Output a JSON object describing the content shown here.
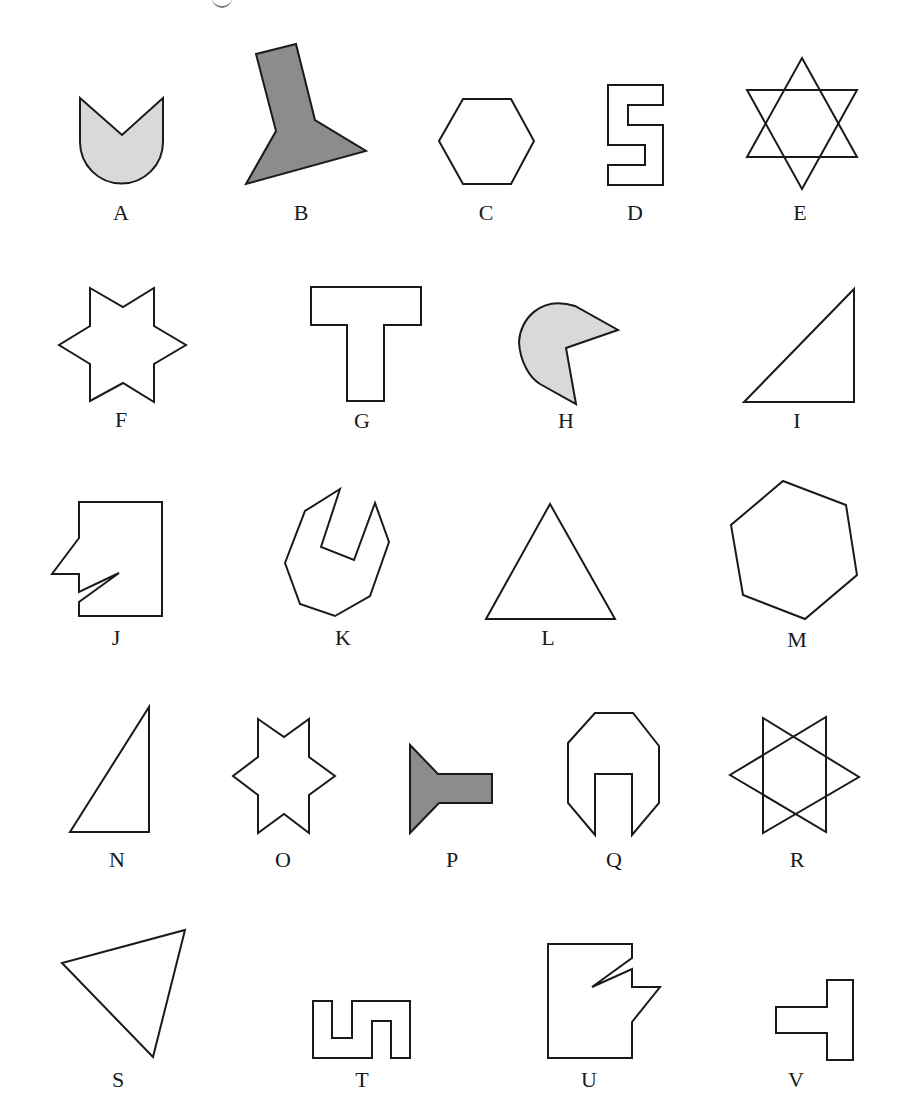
{
  "title_fragment": "g",
  "colors": {
    "stroke": "#1a1a1a",
    "light_fill": "#d9d9d9",
    "dark_fill": "#8c8c8c",
    "background": "#ffffff"
  },
  "shapes": [
    {
      "label": "A",
      "kind": "tulip (V-notched semicircle-bottom shape)",
      "fill": "light"
    },
    {
      "label": "B",
      "kind": "tilted column on triangle base",
      "fill": "dark"
    },
    {
      "label": "C",
      "kind": "regular hexagon (flat top)",
      "fill": "none"
    },
    {
      "label": "D",
      "kind": "S-shaped rectilinear polygon",
      "fill": "none"
    },
    {
      "label": "E",
      "kind": "six-pointed star (two overlapping triangles)",
      "fill": "none"
    },
    {
      "label": "F",
      "kind": "six-pointed star outline",
      "fill": "none"
    },
    {
      "label": "G",
      "kind": "T-shape",
      "fill": "none"
    },
    {
      "label": "H",
      "kind": "pac-man shape with wedge cut",
      "fill": "light"
    },
    {
      "label": "I",
      "kind": "right triangle",
      "fill": "none"
    },
    {
      "label": "J",
      "kind": "rectangle with notched left edge (face profile)",
      "fill": "none"
    },
    {
      "label": "K",
      "kind": "octagon with notch (wrench head)",
      "fill": "none"
    },
    {
      "label": "L",
      "kind": "equilateral triangle",
      "fill": "none"
    },
    {
      "label": "M",
      "kind": "rotated hexagon",
      "fill": "none"
    },
    {
      "label": "N",
      "kind": "narrow right triangle",
      "fill": "none"
    },
    {
      "label": "O",
      "kind": "six-pointed star outline (small)",
      "fill": "none"
    },
    {
      "label": "P",
      "kind": "funnel shape (triangle with bar)",
      "fill": "dark"
    },
    {
      "label": "Q",
      "kind": "octagon with rectangular slot (wrench head)",
      "fill": "none"
    },
    {
      "label": "R",
      "kind": "six-pointed star rotated (two overlapping triangles)",
      "fill": "none"
    },
    {
      "label": "S",
      "kind": "tilted triangle",
      "fill": "none"
    },
    {
      "label": "T",
      "kind": "S-shape rotated rectilinear polygon",
      "fill": "none"
    },
    {
      "label": "U",
      "kind": "rectangle with notched right edge (mirrored face profile)",
      "fill": "none"
    },
    {
      "label": "V",
      "kind": "T-shape rotated 90°",
      "fill": "none"
    }
  ]
}
